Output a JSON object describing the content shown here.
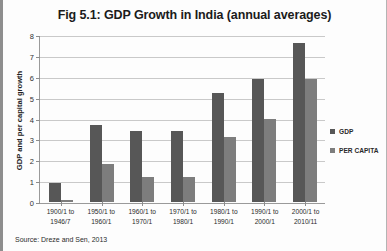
{
  "chart_data": {
    "type": "bar",
    "title": "Fig 5.1: GDP Growth in India (annual averages)",
    "xlabel": "",
    "ylabel": "GDP and per capital growth",
    "ylim": [
      0,
      8
    ],
    "yticks": [
      0,
      1,
      2,
      3,
      4,
      5,
      6,
      7,
      8
    ],
    "grid": true,
    "legend_position": "right",
    "categories": [
      "1900/1 to 1946/7",
      "1950/1 to 1960/1",
      "1960/1 to 1970/1",
      "1970/1 to 1980/1",
      "1980/1 to 1990/1",
      "1990/1 to 2000/1",
      "2000/1 to 2010/11"
    ],
    "category_lines": [
      [
        "1900/1 to",
        "1946/7"
      ],
      [
        "1950/1 to",
        "1960/1"
      ],
      [
        "1960/1 to",
        "1970/1"
      ],
      [
        "1970/1 to",
        "1980/1"
      ],
      [
        "1980/1 to",
        "1990/1"
      ],
      [
        "1990/1 to",
        "2000/1"
      ],
      [
        "2000/1 to",
        "2010/11"
      ]
    ],
    "series": [
      {
        "name": "GDP",
        "color": "#575757",
        "values": [
          0.9,
          3.7,
          3.4,
          3.4,
          5.2,
          5.9,
          7.6
        ]
      },
      {
        "name": "PER CAPITA",
        "color": "#7d7d7d",
        "values": [
          0.1,
          1.8,
          1.2,
          1.2,
          3.1,
          4.0,
          5.9
        ]
      }
    ]
  },
  "source_note": "Source: Dreze and Sen, 2013"
}
